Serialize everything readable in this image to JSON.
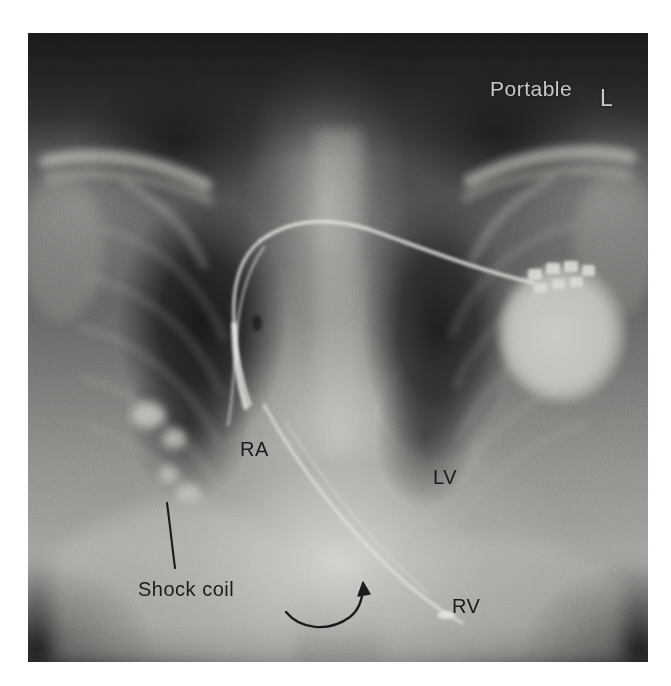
{
  "figure": {
    "kind": "chest-radiograph",
    "modality": "portable-chest-x-ray",
    "projection": "anteroposterior",
    "background_color": "#ffffff",
    "plate_color": "#6d6c6a"
  },
  "technique_markers": [
    {
      "id": "portable",
      "text": "Portable",
      "color": "#c9c9c6",
      "position": "upper-right",
      "meaning": "portable bedside radiograph"
    },
    {
      "id": "laterality",
      "text": "L",
      "color": "#c9c9c6",
      "position": "upper-right",
      "meaning": "left side marker"
    }
  ],
  "anatomical_labels": [
    {
      "id": "ra",
      "text": "RA",
      "color": "#1b1b1b",
      "meaning": "right atrium",
      "x": 240,
      "y": 448
    },
    {
      "id": "lv",
      "text": "LV",
      "color": "#1b1b1b",
      "meaning": "left ventricle",
      "x": 433,
      "y": 476
    },
    {
      "id": "rv",
      "text": "RV",
      "color": "#1b1b1b",
      "meaning": "right ventricle",
      "x": 452,
      "y": 605
    }
  ],
  "device_labels": [
    {
      "id": "shock-coil",
      "text": "Shock coil",
      "color": "#1b1b1b",
      "meaning": "defibrillator shock coil on the ICD lead",
      "x": 138,
      "y": 578,
      "leader": "line from label up-left to the coil in the right atrium"
    }
  ],
  "pointers": [
    {
      "id": "shock-coil-leader",
      "type": "leader-line",
      "color": "#1b1b1b",
      "from": [
        175,
        568
      ],
      "to": [
        167,
        503
      ]
    },
    {
      "id": "rv-lead-arrow",
      "type": "curved-arrow",
      "color": "#1b1b1b",
      "from": [
        286,
        612
      ],
      "to": [
        361,
        582
      ],
      "points_at": "distal right-ventricular lead tip"
    }
  ],
  "hardware": [
    {
      "id": "icd-generator",
      "name": "implantable cardioverter-defibrillator generator",
      "location": "left infraclavicular chest wall",
      "appearance": "bright rounded radiopaque can with connector block"
    },
    {
      "id": "rv-lead",
      "name": "right ventricular defibrillator lead",
      "appearance": "thin radiopaque wire coursing to the cardiac apex"
    },
    {
      "id": "shock-coil-hardware",
      "name": "shock coil",
      "appearance": "thickened dense segment of the lead"
    }
  ],
  "regions": [
    {
      "id": "right-lung-field",
      "label": "right lung field"
    },
    {
      "id": "left-lung-field",
      "label": "left lung field"
    },
    {
      "id": "cardiac-silhouette",
      "label": "cardiac silhouette"
    },
    {
      "id": "mediastinum",
      "label": "mediastinum"
    },
    {
      "id": "right-clavicle",
      "label": "right clavicle"
    },
    {
      "id": "left-clavicle",
      "label": "left clavicle"
    },
    {
      "id": "diaphragm",
      "label": "diaphragm"
    }
  ]
}
